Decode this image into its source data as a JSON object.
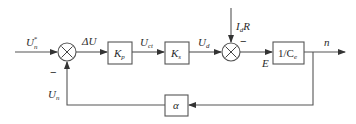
{
  "diagram": {
    "type": "control-block-diagram",
    "signals": {
      "reference": {
        "main": "U",
        "sub": "n",
        "sup": "*"
      },
      "error": "ΔU",
      "control": {
        "main": "U",
        "sub": "ct"
      },
      "voltage": {
        "main": "U",
        "sub": "d"
      },
      "disturbance": {
        "main": "I",
        "sub": "d",
        "tail": "R"
      },
      "emf": "E",
      "output": "n",
      "feedback": {
        "main": "U",
        "sub": "n"
      }
    },
    "blocks": {
      "kp": {
        "main": "K",
        "sub": "p"
      },
      "ka": {
        "main": "K",
        "sub": "s"
      },
      "plant": {
        "main": "1/C",
        "sub": "e"
      },
      "feedback_gain": "α"
    },
    "summing_junctions": [
      {
        "id": "sum1",
        "symbol": "×",
        "minus_label": "−"
      },
      {
        "id": "sum2",
        "symbol": "×",
        "minus_label": "−"
      }
    ]
  }
}
